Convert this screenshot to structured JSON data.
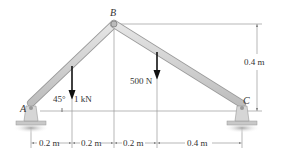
{
  "diagram": {
    "points": {
      "A": "A",
      "B": "B",
      "C": "C"
    },
    "loads": {
      "load1": "1 kN",
      "load2": "500 N"
    },
    "angle": "45°",
    "dimensions": {
      "horizontal": [
        "0.2 m",
        "0.2 m",
        "0.2 m",
        "0.4 m"
      ],
      "vertical": "0.4 m"
    },
    "colors": {
      "member": "#d4d4d4",
      "member_edge": "#9a9a9a",
      "dimension_line": "#8a8a8a",
      "arrow": "#111111",
      "text": "#333333"
    }
  }
}
